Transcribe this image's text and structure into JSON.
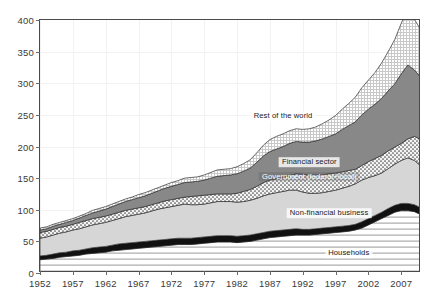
{
  "chart_data": {
    "type": "area",
    "stacked": true,
    "title": "",
    "subtitle": "",
    "xlabel": "",
    "ylabel": "",
    "xlim": [
      1952,
      2010
    ],
    "ylim": [
      0,
      400
    ],
    "yticks": [
      0,
      50,
      100,
      150,
      200,
      250,
      300,
      350,
      400
    ],
    "xticks": [
      1952,
      1957,
      1962,
      1967,
      1972,
      1977,
      1982,
      1987,
      1992,
      1997,
      2002,
      2007
    ],
    "grid": true,
    "legend_position": "in-plot-annotations",
    "x": [
      1952,
      1953,
      1954,
      1955,
      1956,
      1957,
      1958,
      1959,
      1960,
      1961,
      1962,
      1963,
      1964,
      1965,
      1966,
      1967,
      1968,
      1969,
      1970,
      1971,
      1972,
      1973,
      1974,
      1975,
      1976,
      1977,
      1978,
      1979,
      1980,
      1981,
      1982,
      1983,
      1984,
      1985,
      1986,
      1987,
      1988,
      1989,
      1990,
      1991,
      1992,
      1993,
      1994,
      1995,
      1996,
      1997,
      1998,
      1999,
      2000,
      2001,
      2002,
      2003,
      2004,
      2005,
      2006,
      2007,
      2008,
      2009,
      2010
    ],
    "series": [
      {
        "name": "Households",
        "pattern": "horizontal-lines",
        "color": "#ffffff",
        "values": [
          21,
          22,
          23,
          25,
          26,
          27,
          28,
          30,
          31,
          32,
          33,
          35,
          36,
          37,
          38,
          39,
          40,
          41,
          42,
          43,
          44,
          45,
          45,
          45,
          46,
          47,
          48,
          49,
          49,
          49,
          48,
          49,
          50,
          52,
          54,
          56,
          57,
          58,
          59,
          60,
          60,
          60,
          61,
          62,
          63,
          64,
          65,
          66,
          68,
          71,
          76,
          81,
          86,
          91,
          96,
          99,
          99,
          97,
          92
        ]
      },
      {
        "name": "unlabeled-black-band",
        "pattern": "solid-black",
        "color": "#111111",
        "values": [
          6,
          6,
          7,
          7,
          7,
          8,
          8,
          8,
          9,
          9,
          9,
          9,
          10,
          10,
          10,
          10,
          10,
          10,
          10,
          10,
          10,
          10,
          10,
          10,
          10,
          10,
          10,
          10,
          10,
          10,
          10,
          10,
          10,
          10,
          10,
          10,
          10,
          10,
          10,
          10,
          9,
          9,
          9,
          9,
          9,
          9,
          9,
          9,
          9,
          10,
          10,
          10,
          10,
          11,
          11,
          11,
          11,
          11,
          11
        ]
      },
      {
        "name": "Non-financial business",
        "pattern": "light-gray",
        "color": "#d6d6d6",
        "values": [
          28,
          29,
          30,
          31,
          32,
          33,
          34,
          35,
          36,
          37,
          38,
          39,
          40,
          42,
          43,
          44,
          45,
          47,
          49,
          50,
          51,
          52,
          54,
          53,
          52,
          52,
          53,
          54,
          54,
          54,
          54,
          54,
          55,
          56,
          58,
          59,
          60,
          61,
          62,
          61,
          59,
          57,
          56,
          56,
          57,
          58,
          60,
          62,
          64,
          66,
          65,
          63,
          62,
          63,
          65,
          68,
          72,
          70,
          66
        ]
      },
      {
        "name": "Government (federal+local)",
        "pattern": "stipple",
        "color": "#e8e8e8",
        "values": [
          9,
          9,
          9,
          9,
          9,
          9,
          10,
          10,
          10,
          10,
          10,
          10,
          10,
          10,
          10,
          10,
          10,
          10,
          10,
          11,
          11,
          11,
          11,
          13,
          14,
          14,
          13,
          12,
          12,
          12,
          14,
          16,
          17,
          19,
          21,
          22,
          22,
          22,
          23,
          26,
          28,
          29,
          29,
          28,
          28,
          27,
          26,
          25,
          23,
          23,
          25,
          27,
          28,
          28,
          27,
          27,
          30,
          38,
          42
        ]
      },
      {
        "name": "Financial sector",
        "pattern": "dark-gray",
        "color": "#8a8a8a",
        "values": [
          4,
          4,
          5,
          5,
          6,
          6,
          7,
          8,
          9,
          10,
          11,
          12,
          13,
          14,
          15,
          16,
          17,
          18,
          19,
          20,
          21,
          22,
          23,
          23,
          23,
          24,
          26,
          28,
          29,
          30,
          31,
          32,
          34,
          38,
          42,
          45,
          47,
          49,
          51,
          51,
          51,
          52,
          54,
          57,
          59,
          62,
          67,
          71,
          75,
          80,
          83,
          86,
          90,
          95,
          100,
          110,
          117,
          105,
          98
        ]
      },
      {
        "name": "Rest of the world",
        "pattern": "crosshatch",
        "color": "#efefef",
        "values": [
          3,
          3,
          3,
          3,
          3,
          3,
          3,
          3,
          4,
          4,
          4,
          4,
          4,
          4,
          4,
          5,
          5,
          5,
          5,
          5,
          6,
          6,
          7,
          7,
          7,
          8,
          9,
          10,
          10,
          10,
          11,
          12,
          13,
          15,
          17,
          19,
          20,
          20,
          20,
          20,
          20,
          21,
          22,
          24,
          26,
          29,
          32,
          35,
          39,
          43,
          46,
          50,
          56,
          62,
          70,
          80,
          88,
          80,
          75
        ]
      }
    ],
    "annotations": [
      {
        "text": "Rest of the world",
        "x": 1989,
        "y": 248,
        "style": "onlight"
      },
      {
        "text": "Financial sector",
        "x": 1993,
        "y": 175,
        "style": "onlight"
      },
      {
        "text": "Government (federal+local)",
        "x": 1993,
        "y": 152,
        "style": "ondark"
      },
      {
        "text": "Non-financial business",
        "x": 1996,
        "y": 95,
        "style": "onlight"
      },
      {
        "text": "Households",
        "x": 1999,
        "y": 31,
        "style": "onlight"
      }
    ]
  }
}
